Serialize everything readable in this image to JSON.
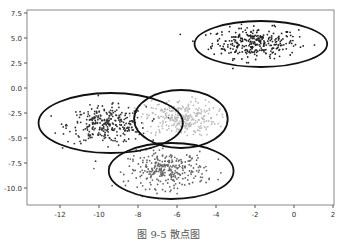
{
  "caption": "图 9-5   散点图",
  "chart_data": {
    "type": "scatter",
    "title": "",
    "xlabel": "",
    "ylabel": "",
    "xlim": [
      -13.5,
      2
    ],
    "ylim": [
      -12,
      7.7
    ],
    "x_ticks": [
      -12,
      -10,
      -8,
      -6,
      -4,
      -2,
      0,
      2
    ],
    "x_tick_labels": [
      "-12",
      "-10",
      "-8",
      "-6",
      "-4",
      "-2",
      "0",
      "2"
    ],
    "y_ticks": [
      7.5,
      5.0,
      2.5,
      0.0,
      -2.5,
      -5.0,
      -7.5,
      -10.0
    ],
    "y_tick_labels": [
      "7.5",
      "5.0",
      "2.5",
      "0.0",
      "-2.5",
      "-5.0",
      "-7.5",
      "-10.0"
    ],
    "grid": false,
    "legend": null,
    "series": [
      {
        "name": "cluster-top-right",
        "color": "#222222",
        "center": [
          -2.0,
          4.5
        ],
        "spread": [
          1.1,
          0.75
        ],
        "n": 300,
        "ellipse": {
          "cx": -1.7,
          "cy": 4.4,
          "rx": 3.4,
          "ry": 2.3
        }
      },
      {
        "name": "cluster-left",
        "color": "#333333",
        "center": [
          -9.6,
          -3.7
        ],
        "spread": [
          1.0,
          0.9
        ],
        "n": 300,
        "ellipse": {
          "cx": -9.4,
          "cy": -3.5,
          "rx": 3.7,
          "ry": 3.0
        }
      },
      {
        "name": "cluster-middle",
        "color": "#bbbbbb",
        "center": [
          -5.8,
          -3.0
        ],
        "spread": [
          0.9,
          0.9
        ],
        "n": 300,
        "ellipse": {
          "cx": -5.8,
          "cy": -3.1,
          "rx": 2.4,
          "ry": 2.9
        }
      },
      {
        "name": "cluster-bottom",
        "color": "#666666",
        "center": [
          -6.5,
          -8.2
        ],
        "spread": [
          1.0,
          0.9
        ],
        "n": 300,
        "ellipse": {
          "cx": -6.3,
          "cy": -8.3,
          "rx": 3.2,
          "ry": 2.8
        }
      }
    ]
  }
}
